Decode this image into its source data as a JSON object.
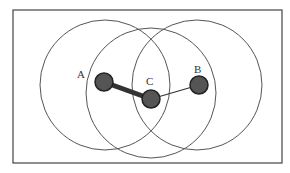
{
  "diagram": {
    "type": "wireless-range-overlap",
    "frame": {
      "x": 13,
      "y": 10,
      "width": 269,
      "height": 153,
      "stroke": "#444444"
    },
    "ranges": [
      {
        "id": "range-a",
        "cx": 105,
        "cy": 85,
        "r": 65
      },
      {
        "id": "range-c",
        "cx": 151,
        "cy": 93,
        "r": 65
      },
      {
        "id": "range-b",
        "cx": 197,
        "cy": 85,
        "r": 65
      }
    ],
    "nodes": [
      {
        "id": "A",
        "label": "A",
        "cx": 104,
        "cy": 82,
        "r": 9,
        "label_x": 80,
        "label_y": 78
      },
      {
        "id": "C",
        "label": "C",
        "cx": 151,
        "cy": 99,
        "r": 9,
        "label_x": 150,
        "label_y": 84
      },
      {
        "id": "B",
        "label": "B",
        "cx": 199,
        "cy": 85,
        "r": 9,
        "label_x": 198,
        "label_y": 72
      }
    ],
    "links": [
      {
        "from": "A",
        "to": "C",
        "weight": "thick",
        "width": 5
      },
      {
        "from": "C",
        "to": "B",
        "weight": "thin",
        "width": 1.2
      }
    ],
    "colors": {
      "circle_stroke": "#555555",
      "node_fill": "#555555",
      "node_stroke": "#222222",
      "link": "#333333",
      "background": "#ffffff"
    }
  }
}
